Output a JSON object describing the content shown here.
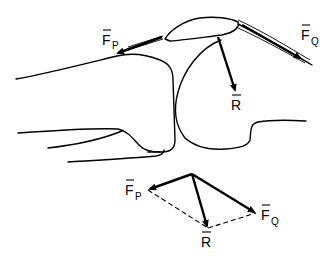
{
  "figure": {
    "type": "anatomical-force-diagram",
    "colors": {
      "ink": "#000000",
      "background": "#ffffff"
    }
  },
  "labels": {
    "force_patellar": {
      "main": "F",
      "sub": "P"
    },
    "force_quadriceps": {
      "main": "F",
      "sub": "Q"
    },
    "resultant": {
      "main": "R"
    }
  },
  "vector_diagram": {
    "labels": {
      "force_patellar": {
        "main": "F",
        "sub": "P"
      },
      "force_quadriceps": {
        "main": "F",
        "sub": "Q"
      },
      "resultant": {
        "main": "R"
      }
    },
    "description": "Parallelogram of forces: F_P + F_Q = R (dashed completion lines)"
  }
}
